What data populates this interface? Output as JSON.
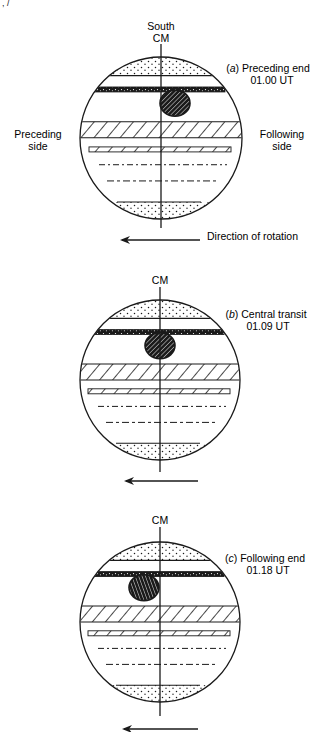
{
  "corner_fragment": ", /",
  "figures": [
    {
      "id": "a",
      "top_labels": [
        "South",
        "CM"
      ],
      "caption_letter": "a",
      "caption_title": "Preceding end",
      "caption_time": "01.00 UT",
      "left_label": [
        "Preceding",
        "side"
      ],
      "right_label": [
        "Following",
        "side"
      ],
      "arrow_label": "Direction of rotation",
      "spot_position": "east-of-cm"
    },
    {
      "id": "b",
      "top_labels": [
        "CM"
      ],
      "caption_letter": "b",
      "caption_title": "Central transit",
      "caption_time": "01.09 UT",
      "spot_position": "on-cm"
    },
    {
      "id": "c",
      "top_labels": [
        "CM"
      ],
      "caption_letter": "c",
      "caption_title": "Following end",
      "caption_time": "01.18 UT",
      "spot_position": "west-of-cm"
    }
  ],
  "legend_semantics": {
    "dotted_band": "polar-region",
    "dark_band": "dark-belt",
    "spot": "red-spot",
    "hatched_band": "hatched-belt",
    "thin_hatched_band": "thin-belt",
    "dashed_line": "faint-belt"
  },
  "colors": {
    "ink": "#1a1a1a",
    "paper": "#ffffff"
  }
}
